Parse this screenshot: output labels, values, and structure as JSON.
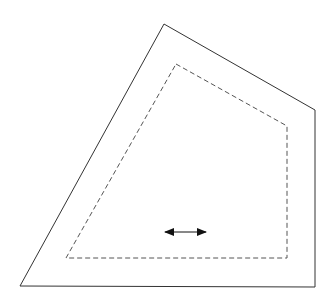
{
  "diagram": {
    "width": 330,
    "height": 308,
    "background": "#ffffff",
    "outer_polygon": {
      "style": "solid",
      "stroke": "#333333",
      "stroke_width": 1,
      "points": [
        [
          164,
          24
        ],
        [
          315,
          110
        ],
        [
          315,
          287
        ],
        [
          20,
          286
        ]
      ]
    },
    "inner_polygon": {
      "style": "dashed",
      "stroke": "#555555",
      "stroke_width": 1,
      "dash": "5,3",
      "points": [
        [
          176,
          64
        ],
        [
          287,
          126
        ],
        [
          287,
          258
        ],
        [
          66,
          258
        ]
      ]
    },
    "arrow": {
      "type": "double-headed",
      "orientation": "horizontal",
      "stroke": "#111111",
      "x1": 156,
      "x2": 215,
      "y": 232
    }
  }
}
